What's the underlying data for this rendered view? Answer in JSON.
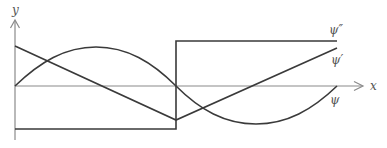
{
  "diagram": {
    "axes": {
      "y_label": "y",
      "x_label": "x"
    },
    "curves": [
      {
        "id": "psi",
        "label": "ψ",
        "kind": "sine",
        "description": "one full sine period: 0 → max → 0 → min → 0"
      },
      {
        "id": "psi_prime",
        "label": "ψ′",
        "kind": "piecewise-linear",
        "description": "decreasing line to a V-minimum at midpoint, then increasing"
      },
      {
        "id": "psi_double_prime",
        "label": "ψ″",
        "kind": "step",
        "description": "constant negative level, jump at midpoint to constant positive level"
      }
    ],
    "colors": {
      "curve": "#3a3a3a",
      "axis": "#8a8a8a",
      "label": "#555555"
    }
  }
}
